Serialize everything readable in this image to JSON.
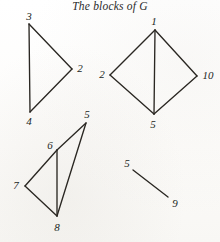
{
  "figure": {
    "title": "The blocks of G",
    "width": 220,
    "height": 242,
    "ink_color": "#2a2722",
    "paper_color": "#fdfdfc"
  },
  "chart_data": {
    "type": "diagram",
    "title": "The blocks of G",
    "blocks": [
      {
        "name": "block-triangle-324",
        "vertices": [
          {
            "label": "3",
            "x": 29,
            "y": 24,
            "label_x": 29,
            "label_y": 16
          },
          {
            "label": "2",
            "x": 72,
            "y": 69,
            "label_x": 80,
            "label_y": 68
          },
          {
            "label": "4",
            "x": 30,
            "y": 112,
            "label_x": 29,
            "label_y": 121
          }
        ],
        "edges": [
          {
            "from": "3",
            "to": "2"
          },
          {
            "from": "2",
            "to": "4"
          },
          {
            "from": "4",
            "to": "3"
          }
        ]
      },
      {
        "name": "block-diamond-12-10-5",
        "vertices": [
          {
            "label": "1",
            "x": 155,
            "y": 30,
            "label_x": 154,
            "label_y": 21
          },
          {
            "label": "2",
            "x": 110,
            "y": 75,
            "label_x": 102,
            "label_y": 74
          },
          {
            "label": "10",
            "x": 197,
            "y": 76,
            "label_x": 208,
            "label_y": 75
          },
          {
            "label": "5",
            "x": 154,
            "y": 114,
            "label_x": 153,
            "label_y": 124
          }
        ],
        "edges": [
          {
            "from": "1",
            "to": "2"
          },
          {
            "from": "1",
            "to": "10"
          },
          {
            "from": "1",
            "to": "5"
          },
          {
            "from": "2",
            "to": "5"
          },
          {
            "from": "10",
            "to": "5"
          }
        ]
      },
      {
        "name": "block-5678",
        "vertices": [
          {
            "label": "5",
            "x": 86,
            "y": 123,
            "label_x": 87,
            "label_y": 114
          },
          {
            "label": "6",
            "x": 57,
            "y": 150,
            "label_x": 50,
            "label_y": 145
          },
          {
            "label": "7",
            "x": 25,
            "y": 186,
            "label_x": 16,
            "label_y": 185
          },
          {
            "label": "8",
            "x": 57,
            "y": 216,
            "label_x": 57,
            "label_y": 227
          }
        ],
        "edges": [
          {
            "from": "5",
            "to": "6"
          },
          {
            "from": "5",
            "to": "8"
          },
          {
            "from": "6",
            "to": "7"
          },
          {
            "from": "6",
            "to": "8"
          },
          {
            "from": "7",
            "to": "8"
          }
        ]
      },
      {
        "name": "block-edge-59",
        "vertices": [
          {
            "label": "5",
            "x": 133,
            "y": 170,
            "label_x": 127,
            "label_y": 163
          },
          {
            "label": "9",
            "x": 168,
            "y": 197,
            "label_x": 175,
            "label_y": 203
          }
        ],
        "edges": [
          {
            "from": "5",
            "to": "9"
          }
        ]
      }
    ]
  }
}
